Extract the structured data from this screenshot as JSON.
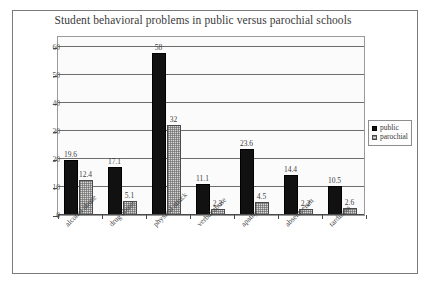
{
  "chart_data": {
    "type": "bar",
    "title": "Student behavioral problems in public versus parochial schools",
    "xlabel": "",
    "ylabel": "",
    "ylim": [
      0,
      60
    ],
    "yticks": [
      0,
      10,
      20,
      30,
      40,
      50,
      60
    ],
    "grid": true,
    "legend_position": "right",
    "categories": [
      "alcohol abuse",
      "drug abuse",
      "physical attack",
      "verbal abuse",
      "apathy",
      "absenteeism",
      "tardiness"
    ],
    "series": [
      {
        "name": "public",
        "color": "#111111",
        "values": [
          19.6,
          17.1,
          58,
          11.1,
          23.6,
          14.4,
          10.5
        ],
        "value_labels": [
          "19.6",
          "17.1",
          "58",
          "11.1",
          "23.6",
          "14.4",
          "10.5"
        ]
      },
      {
        "name": "parochial",
        "color": "#d8d8d8",
        "values": [
          12.4,
          5.1,
          32,
          2.3,
          4.5,
          2.2,
          2.6
        ],
        "value_labels": [
          "12.4",
          "5.1",
          "32",
          "2.3",
          "4.5",
          "2.2",
          "2.6"
        ]
      }
    ]
  },
  "legend": {
    "entries": [
      {
        "label": "public"
      },
      {
        "label": "parochial"
      }
    ]
  },
  "axis": {
    "y_tick_labels": [
      "60",
      "50",
      "40",
      "30",
      "20",
      "10",
      "0"
    ]
  }
}
